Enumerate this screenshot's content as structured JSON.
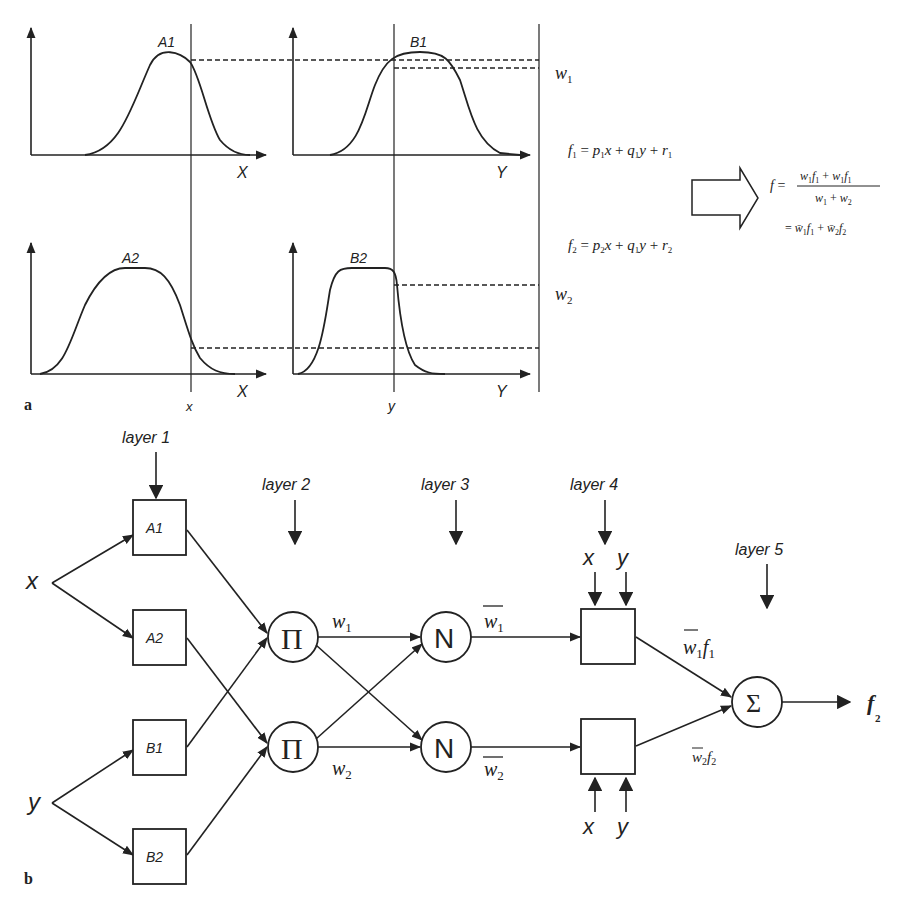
{
  "panel_a": {
    "label": "a",
    "mf_plots": [
      {
        "id": "A1",
        "label": "A1",
        "axis": "X"
      },
      {
        "id": "B1",
        "label": "B1",
        "axis": "Y"
      },
      {
        "id": "A2",
        "label": "A2",
        "axis": "X"
      },
      {
        "id": "B2",
        "label": "B2",
        "axis": "Y"
      }
    ],
    "input_x": "x",
    "input_y": "y",
    "w1": "w1",
    "w2": "w2",
    "rules": {
      "f1": "f1 = p1x + q1y + r1",
      "f2": "f2 = p2x + q1y + r2"
    },
    "result": {
      "lhs": "f =",
      "numerator": "w1f1 + w1f1",
      "denominator": "w1 + w2",
      "second_line": "= w̄1f1 + w̄2f2"
    }
  },
  "panel_b": {
    "label": "b",
    "layers": [
      "layer 1",
      "layer 2",
      "layer 3",
      "layer 4",
      "layer 5"
    ],
    "inputs": {
      "x": "x",
      "y": "y"
    },
    "layer1_nodes": [
      "A1",
      "A2",
      "B1",
      "B2"
    ],
    "layer2_nodes": [
      "Π",
      "Π"
    ],
    "layer3_nodes": [
      "N",
      "N"
    ],
    "layer4_inputs": [
      "x",
      "y"
    ],
    "layer5_node": "Σ",
    "edge_labels": {
      "w1": "w1",
      "w2": "w2",
      "w1bar": "w̄1",
      "w2bar": "w̄2",
      "w1bar_f1": "w̄1f1",
      "w2bar_f2": "w̄2f2"
    },
    "output": "f2"
  }
}
